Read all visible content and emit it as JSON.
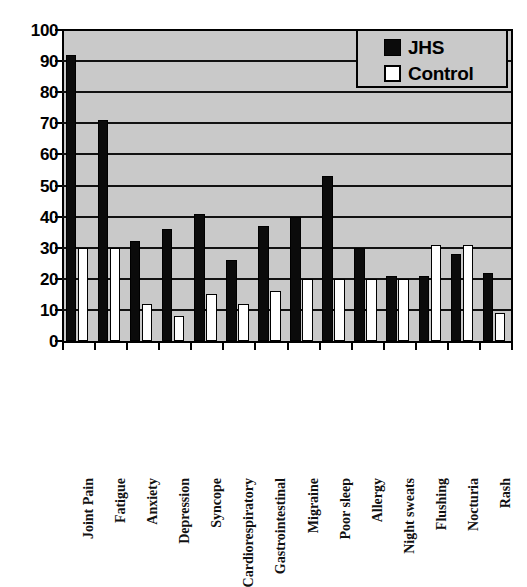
{
  "chart_data": {
    "type": "bar",
    "title": "",
    "subtitle": "",
    "xlabel": "",
    "ylabel": "",
    "ylim": [
      0,
      100
    ],
    "ytick_step": 10,
    "yticks": [
      100,
      90,
      80,
      70,
      60,
      50,
      40,
      30,
      20,
      10,
      0
    ],
    "grid": "horizontal",
    "legend_position": "top-right",
    "plot_background": "#c9c9c9",
    "categories": [
      "Joint Pain",
      "Fatigue",
      "Anxiety",
      "Depression",
      "Syncope",
      "Cardiorespiratory",
      "Gastrointestinal",
      "Migraine",
      "Poor sleep",
      "Allergy",
      "Night sweats",
      "Flushing",
      "Nocturia",
      "Rash"
    ],
    "series": [
      {
        "name": "JHS",
        "color": "#0b0b0b",
        "values": [
          92,
          71,
          32,
          36,
          41,
          26,
          37,
          40,
          53,
          30,
          21,
          21,
          28,
          22
        ]
      },
      {
        "name": "Control",
        "color": "#ffffff",
        "values": [
          30,
          30,
          12,
          8,
          15,
          12,
          16,
          20,
          20,
          20,
          20,
          31,
          31,
          9
        ]
      }
    ]
  },
  "legend": {
    "entries": [
      {
        "label": "JHS"
      },
      {
        "label": "Control"
      }
    ]
  }
}
